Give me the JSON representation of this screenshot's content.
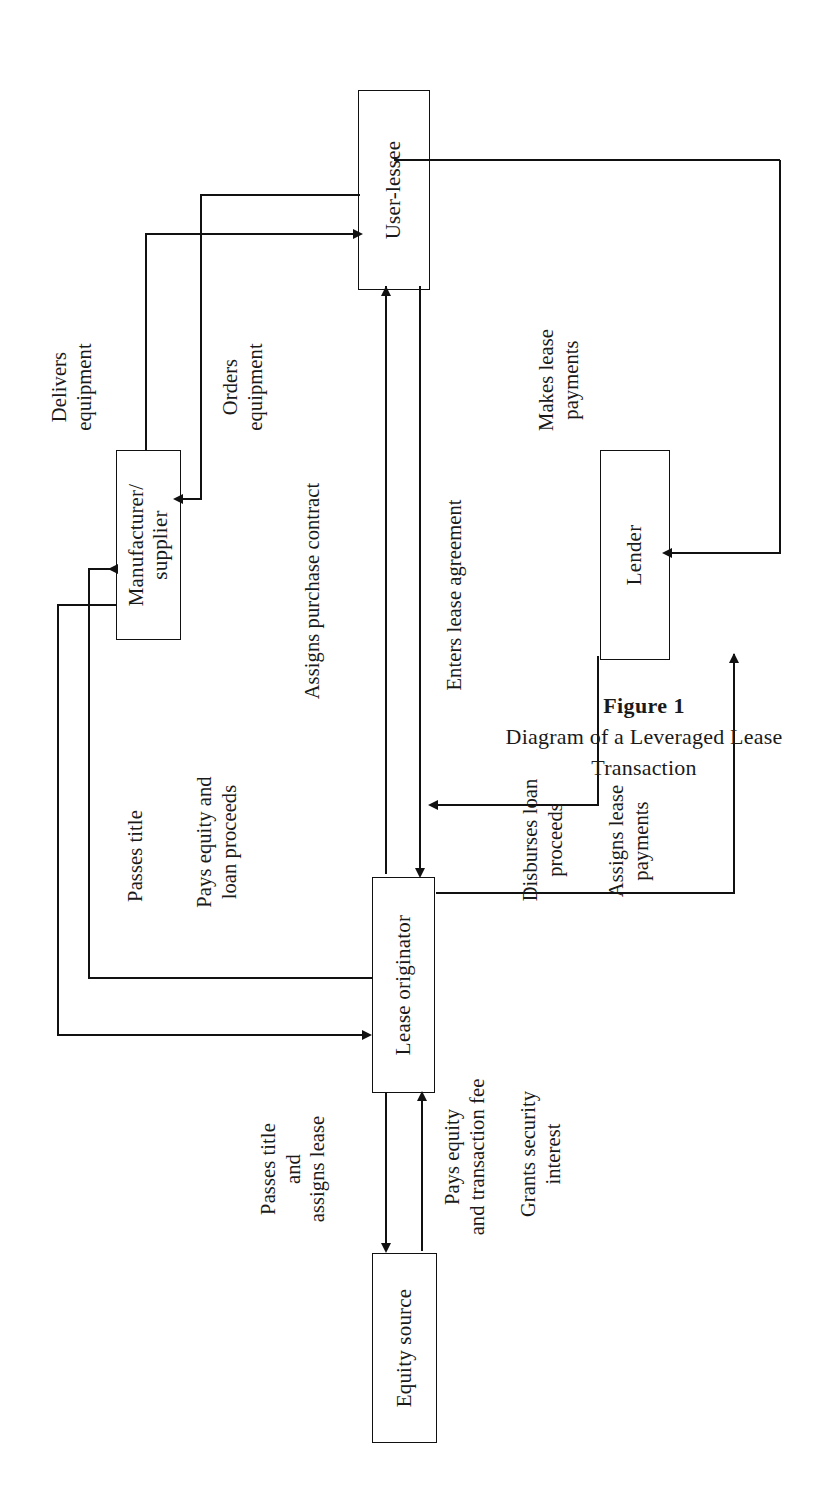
{
  "figure": {
    "number": "Figure 1",
    "title": "Diagram of a Leveraged Lease Transaction"
  },
  "nodes": [
    {
      "id": "user-lessee",
      "label": "User-lessee"
    },
    {
      "id": "manufacturer-supplier",
      "label": "Manufacturer/\nsupplier"
    },
    {
      "id": "lender",
      "label": "Lender"
    },
    {
      "id": "lease-originator",
      "label": "Lease\noriginator"
    },
    {
      "id": "equity-source",
      "label": "Equity source"
    }
  ],
  "edge_labels": [
    {
      "id": "delivers-equipment",
      "text": "Delivers\nequipment"
    },
    {
      "id": "orders-equipment",
      "text": "Orders\nequipment"
    },
    {
      "id": "assigns-purchase-contract",
      "text": "Assigns purchase contract"
    },
    {
      "id": "enters-lease-agreement",
      "text": "Enters lease agreement"
    },
    {
      "id": "makes-lease-payments",
      "text": "Makes lease\npayments"
    },
    {
      "id": "passes-title",
      "text": "Passes title"
    },
    {
      "id": "pays-equity-and-loan-proceeds",
      "text": "Pays equity and\nloan proceeds"
    },
    {
      "id": "disburses-loan-proceeds",
      "text": "Disburses loan\nproceeds"
    },
    {
      "id": "assigns-lease-payments",
      "text": "Assigns lease\npayments"
    },
    {
      "id": "passes-title-and-assigns-lease",
      "text": "Passes title\nand\nassigns lease"
    },
    {
      "id": "pays-equity-and-transaction-fee",
      "text": "Pays equity\nand transaction fee"
    },
    {
      "id": "grants-security-interest",
      "text": "Grants security\ninterest"
    }
  ],
  "diagram_data": {
    "type": "diagram",
    "orientation": "rotated-90-ccw",
    "entities": [
      "User-lessee",
      "Manufacturer/supplier",
      "Lender",
      "Lease originator",
      "Equity source"
    ],
    "relations": [
      {
        "from": "Manufacturer/supplier",
        "to": "User-lessee",
        "label": "Delivers equipment"
      },
      {
        "from": "User-lessee",
        "to": "Manufacturer/supplier",
        "label": "Orders equipment"
      },
      {
        "from": "Lease originator",
        "to": "User-lessee",
        "label": "Assigns purchase contract"
      },
      {
        "from": "User-lessee",
        "to": "Lease originator",
        "label": "Enters lease agreement"
      },
      {
        "from": "User-lessee",
        "to": "Lender",
        "label": "Makes lease payments"
      },
      {
        "from": "Manufacturer/supplier",
        "to": "Lease originator",
        "label": "Passes title"
      },
      {
        "from": "Lease originator",
        "to": "Manufacturer/supplier",
        "label": "Pays equity and loan proceeds"
      },
      {
        "from": "Lender",
        "to": "Lease originator",
        "label": "Disburses loan proceeds"
      },
      {
        "from": "Lease originator",
        "to": "Lender",
        "label": "Assigns lease payments"
      },
      {
        "from": "Lease originator",
        "to": "Equity source",
        "label": "Passes title and assigns lease"
      },
      {
        "from": "Equity source",
        "to": "Lease originator",
        "label": "Pays equity and transaction fee"
      },
      {
        "from": "Lease originator",
        "to": "Lender",
        "label": "Grants security interest"
      }
    ]
  }
}
